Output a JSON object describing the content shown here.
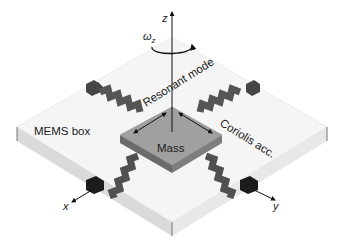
{
  "figure": {
    "labels": {
      "z_axis": "z",
      "x_axis": "x",
      "y_axis": "y",
      "omega": "ω",
      "omega_sub": "z",
      "resonant_mode": "Resonant mode",
      "coriolis": "Coriolis acc.",
      "mass": "Mass",
      "mems_box": "MEMS box"
    },
    "colors": {
      "box_top": "#f4f4f4",
      "box_side_left": "#dcdcdc",
      "box_side_right": "#e6e6e6",
      "mass_top": "#9a9a9a",
      "mass_side": "#6a6a6a",
      "spring": "#555555",
      "spring_dark": "#3a3a3a",
      "anchor_front": "#1e1e1e",
      "anchor_back": "#4a4a4a",
      "line": "#111111"
    }
  }
}
